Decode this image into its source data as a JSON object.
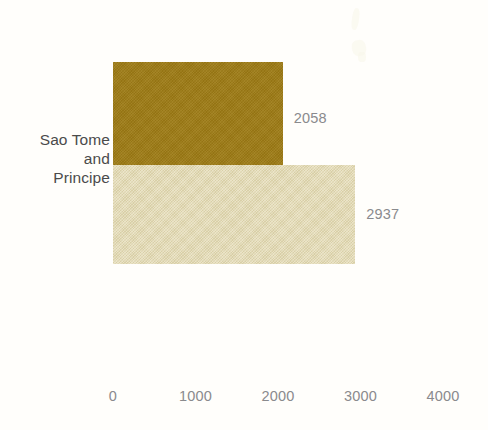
{
  "chart_data": {
    "type": "bar",
    "orientation": "horizontal",
    "title": "",
    "subtitle": "",
    "xlabel": "",
    "ylabel": "",
    "categories": [
      "Sao Tome and Principe"
    ],
    "category_label_lines": "Sao Tome\nand\nPrincipe",
    "series": [
      {
        "name": "series-1",
        "values": [
          2058
        ],
        "color": "#9d7a14"
      },
      {
        "name": "series-2",
        "values": [
          2937
        ],
        "color": "#e1d7ad"
      }
    ],
    "data_labels": [
      "2058",
      "2937"
    ],
    "xlim": [
      0,
      4000
    ],
    "xticks": [
      0,
      1000,
      2000,
      3000,
      4000
    ],
    "xtick_labels": [
      "0",
      "1000",
      "2000",
      "3000",
      "4000"
    ],
    "grid": false,
    "legend": "none",
    "axis_line": false,
    "background_color": "#fffefb",
    "tick_text_color": "#8a8a8d",
    "category_text_color": "#4b4b4b"
  },
  "labels": {
    "category": "Sao Tome\nand\nPrincipe",
    "value_0": "2058",
    "value_1": "2937",
    "tick_0": "0",
    "tick_1": "1000",
    "tick_2": "2000",
    "tick_3": "3000",
    "tick_4": "4000"
  }
}
